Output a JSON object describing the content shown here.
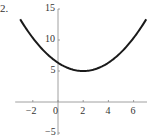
{
  "problem_label": "2.",
  "chart_data": {
    "type": "line",
    "title": "",
    "xlabel": "",
    "ylabel": "",
    "xlim": [
      -3,
      7
    ],
    "ylim": [
      -5,
      15
    ],
    "grid": false,
    "legend": null,
    "x_ticks": [
      -2,
      0,
      2,
      4,
      6
    ],
    "y_ticks": [
      -5,
      5,
      10,
      15
    ],
    "function": "y = (1/3)(x - 2)^2 + 5",
    "vertex": [
      2,
      5
    ],
    "series": [
      {
        "name": "curve",
        "x": [
          -3,
          -2,
          -1,
          0,
          1,
          2,
          3,
          4,
          5,
          6,
          7
        ],
        "y": [
          13.33,
          10.33,
          8,
          6.33,
          5.33,
          5,
          5.33,
          6.33,
          8,
          10.33,
          13.33
        ]
      }
    ]
  },
  "colors": {
    "curve": "#1a1a1a",
    "axis": "#888888",
    "text": "#333333"
  }
}
